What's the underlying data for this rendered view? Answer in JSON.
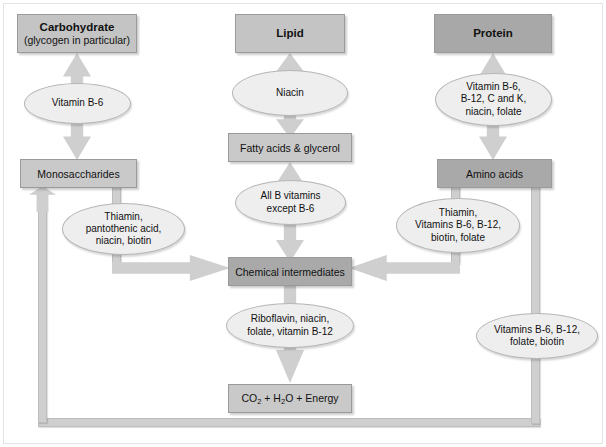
{
  "diagram": {
    "colors": {
      "box_header": "#c4c4c4",
      "box_header_dark": "#a8a8a8",
      "box_mid": "#c9c9c9",
      "box_mid_dark": "#a9a9a9",
      "oval": "#eeeeee",
      "arrow": "#cfcfcf",
      "text": "#111111",
      "background": "#ffffff"
    }
  },
  "columns": {
    "carbohydrate": {
      "header_title": "Carbohydrate",
      "header_subtitle": "(glycogen in particular)",
      "vitamin_oval": "Vitamin B-6",
      "product_box": "Monosaccharides",
      "to_intermediates_oval_lines": [
        "Thiamin,",
        "pantothenic acid,",
        "niacin, biotin"
      ]
    },
    "lipid": {
      "header_title": "Lipid",
      "vitamin_oval": "Niacin",
      "product_box": "Fatty acids & glycerol",
      "to_intermediates_oval_lines": [
        "All B vitamins",
        "except B-6"
      ]
    },
    "protein": {
      "header_title": "Protein",
      "vitamin_oval_lines": [
        "Vitamin B-6,",
        "B-12, C and K,",
        "niacin, folate"
      ],
      "product_box": "Amino acids",
      "to_intermediates_oval_lines": [
        "Thiamin,",
        "Vitamins B-6, B-12,",
        "biotin, folate"
      ]
    }
  },
  "center": {
    "intermediates_box": "Chemical intermediates",
    "oxidation_oval_lines": [
      "Riboflavin, niacin,",
      "folate, vitamin B-12"
    ],
    "energy_box_prefix": "CO",
    "energy_box_sub1": "2",
    "energy_box_mid": " + H",
    "energy_box_sub2": "2",
    "energy_box_suffix": "O + Energy"
  },
  "feedback": {
    "right_oval_lines": [
      "Vitamins B-6, B-12,",
      "folate, biotin"
    ]
  }
}
